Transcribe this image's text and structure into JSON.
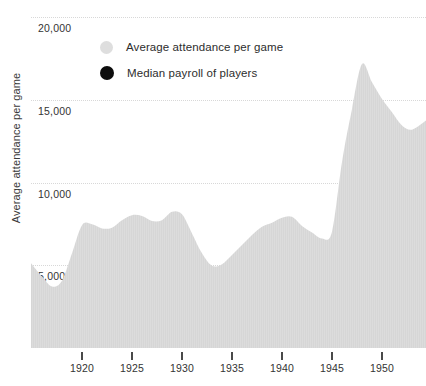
{
  "chart_data": {
    "type": "area",
    "title": "",
    "xlabel": "",
    "ylabel": "Average attendance per game",
    "xlim": [
      1914.9,
      1954.4
    ],
    "ylim": [
      0,
      20960
    ],
    "grid": true,
    "grid_axis": "y",
    "legend_position": "top-left-inside",
    "y_ticks": [
      20000,
      15000,
      10000,
      5000
    ],
    "y_tick_labels": [
      "20,000",
      "15,000",
      "10,000",
      "5,000"
    ],
    "x_ticks": [
      1920,
      1925,
      1930,
      1935,
      1940,
      1945,
      1950
    ],
    "x_tick_labels": [
      "1920",
      "1925",
      "1930",
      "1935",
      "1940",
      "1945",
      "1950"
    ],
    "colors": {
      "area_fill": "#dcdcdc",
      "gridline": "#d8d8d8",
      "axis_text": "#333333",
      "median_payroll_marker": "#0d0d0d"
    },
    "series": [
      {
        "name": "Average attendance per game",
        "kind": "area",
        "color": "#dcdcdc",
        "x": [
          1914.9,
          1916,
          1917,
          1918,
          1919,
          1920,
          1921,
          1922,
          1923,
          1924,
          1925,
          1926,
          1927,
          1928,
          1929,
          1930,
          1931,
          1932,
          1933,
          1934,
          1935,
          1936,
          1937,
          1938,
          1939,
          1940,
          1941,
          1942,
          1943,
          1944,
          1945,
          1946,
          1947,
          1948,
          1949,
          1950,
          1951,
          1952,
          1953,
          1954.4
        ],
        "values": [
          5100,
          4300,
          3700,
          4050,
          5700,
          7400,
          7450,
          7200,
          7250,
          7700,
          8000,
          7950,
          7650,
          7700,
          8200,
          8050,
          6900,
          5700,
          4950,
          5050,
          5600,
          6200,
          6800,
          7300,
          7550,
          7850,
          7900,
          7350,
          6950,
          6600,
          7000,
          11200,
          14400,
          17100,
          16000,
          15000,
          14200,
          13400,
          13150,
          13700
        ]
      },
      {
        "name": "Median payroll of players",
        "kind": "scatter",
        "color": "#0d0d0d",
        "x": [],
        "values": [],
        "note": "series marker shown in legend only; no points visible within plotted range"
      }
    ]
  },
  "legend": {
    "items": [
      {
        "label": "Average attendance per game",
        "marker": "filled-circle-gray"
      },
      {
        "label": "Median payroll of players",
        "marker": "filled-circle-black"
      }
    ]
  },
  "axes": {
    "y_title": "Average attendance per game"
  }
}
